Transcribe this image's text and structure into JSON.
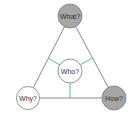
{
  "diagram": {
    "type": "triangle",
    "colors": {
      "edge": "#8a8a8a",
      "spoke": "#5aafd6",
      "filled_node": "#a6a6a6",
      "empty_node": "#ffffff",
      "node_stroke": "#7a7a7a",
      "text": "#333333"
    },
    "nodes": {
      "top": {
        "label": "What?",
        "filled": true
      },
      "left": {
        "label": "Why?",
        "filled": false
      },
      "right": {
        "label": "How?",
        "filled": true
      },
      "center": {
        "label": "Who?",
        "filled": false
      }
    },
    "edges": [
      {
        "from": "What?",
        "to": "Why?"
      },
      {
        "from": "What?",
        "to": "How?"
      },
      {
        "from": "Why?",
        "to": "How?"
      }
    ],
    "spokes": [
      {
        "from": "Who?",
        "to": "left-edge-midpoint"
      },
      {
        "from": "Who?",
        "to": "right-edge-midpoint"
      },
      {
        "from": "Who?",
        "to": "bottom-edge-midpoint"
      }
    ]
  }
}
